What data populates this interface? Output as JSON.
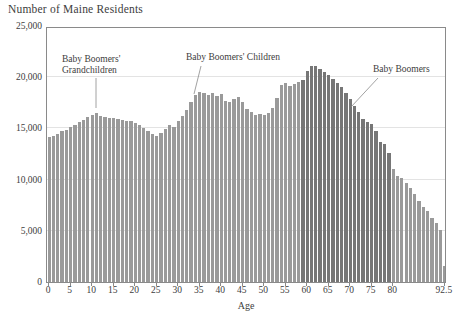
{
  "chart_data": {
    "type": "bar",
    "title": "Number of Maine Residents",
    "xlabel": "Age",
    "ylabel": "",
    "grid": true,
    "legend_position": "none",
    "xlim": [
      -0.5,
      93.5
    ],
    "ylim": [
      0,
      25000
    ],
    "y_ticks": [
      0,
      5000,
      10000,
      15000,
      20000,
      25000
    ],
    "y_tick_labels": [
      "0",
      "5,000",
      "10,000",
      "15,000",
      "20,000",
      "25,000"
    ],
    "x_ticks": [
      0,
      5,
      10,
      15,
      20,
      25,
      30,
      35,
      40,
      45,
      50,
      55,
      60,
      65,
      70,
      75,
      80,
      92.5
    ],
    "x_tick_labels": [
      "0",
      "5",
      "10",
      "15",
      "20",
      "25",
      "30",
      "35",
      "40",
      "45",
      "50",
      "55",
      "60",
      "65",
      "70",
      "75",
      "80",
      "92.5"
    ],
    "bar_colors": {
      "default": "#9a9a9a",
      "highlight": "#767676"
    },
    "highlight_range": [
      59,
      79
    ],
    "categories": [
      0,
      1,
      2,
      3,
      4,
      5,
      6,
      7,
      8,
      9,
      10,
      11,
      12,
      13,
      14,
      15,
      16,
      17,
      18,
      19,
      20,
      21,
      22,
      23,
      24,
      25,
      26,
      27,
      28,
      29,
      30,
      31,
      32,
      33,
      34,
      35,
      36,
      37,
      38,
      39,
      40,
      41,
      42,
      43,
      44,
      45,
      46,
      47,
      48,
      49,
      50,
      51,
      52,
      53,
      54,
      55,
      56,
      57,
      58,
      59,
      60,
      61,
      62,
      63,
      64,
      65,
      66,
      67,
      68,
      69,
      70,
      71,
      72,
      73,
      74,
      75,
      76,
      77,
      78,
      79,
      80,
      81,
      82,
      83,
      84,
      85,
      86,
      87,
      88,
      89,
      90,
      91,
      92.5
    ],
    "values": [
      14200,
      14300,
      14500,
      14700,
      14800,
      15100,
      15300,
      15600,
      15800,
      16100,
      16300,
      16500,
      16200,
      16100,
      16000,
      16000,
      15900,
      15800,
      15700,
      15700,
      15500,
      15300,
      15000,
      14700,
      14500,
      14300,
      14600,
      14900,
      15300,
      15100,
      15700,
      16200,
      16800,
      17600,
      18300,
      18600,
      18500,
      18300,
      18500,
      18200,
      18400,
      17700,
      17600,
      17900,
      18100,
      17600,
      16900,
      16600,
      16300,
      16400,
      16300,
      16500,
      17000,
      18000,
      19200,
      19400,
      19100,
      19300,
      19500,
      19700,
      20600,
      21100,
      21100,
      20800,
      20500,
      20200,
      19800,
      19400,
      19000,
      18500,
      17900,
      17200,
      16600,
      15900,
      15600,
      15400,
      14700,
      13700,
      13500,
      12600,
      11000,
      10400,
      10200,
      9700,
      9200,
      8600,
      7900,
      7300,
      6900,
      6300,
      5800,
      5100,
      1600
    ],
    "annotations": [
      {
        "id": "grandchildren",
        "text_line1": "Baby Boomers'",
        "text_line2": "Grandchildren",
        "target_age": 10
      },
      {
        "id": "children",
        "text_line1": "Baby Boomers' Children",
        "text_line2": "",
        "target_age": 35
      },
      {
        "id": "boomers",
        "text_line1": "Baby Boomers",
        "text_line2": "",
        "target_age": 74
      }
    ]
  }
}
